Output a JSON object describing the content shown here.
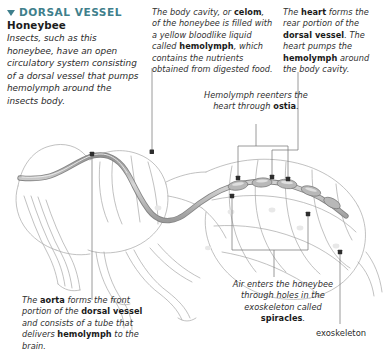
{
  "header": {
    "disclosure_icon": "triangle-down-icon",
    "section_title": "DORSAL VESSEL",
    "species": "Honeybee",
    "intro": "Insects, such as this honeybee, have an open circulatory system consisting of a dorsal vessel that pumps hemolymph around the insects body.",
    "accent_color": "#3f7f8c"
  },
  "callouts": {
    "celom": {
      "segments": [
        {
          "text": "The body cavity, or ",
          "bold": false
        },
        {
          "text": "celom",
          "bold": true
        },
        {
          "text": ", of the honeybee is filled with a yellow bloodlike liquid called ",
          "bold": false
        },
        {
          "text": "hemolymph",
          "bold": true
        },
        {
          "text": ", which contains the nutrients obtained from digested food.",
          "bold": false
        }
      ]
    },
    "heart": {
      "segments": [
        {
          "text": "The ",
          "bold": false
        },
        {
          "text": "heart",
          "bold": true
        },
        {
          "text": " forms the rear portion of the ",
          "bold": false
        },
        {
          "text": "dorsal vessel",
          "bold": true
        },
        {
          "text": ". The heart pumps the ",
          "bold": false
        },
        {
          "text": "hemolymph",
          "bold": true
        },
        {
          "text": " around the body cavity.",
          "bold": false
        }
      ]
    },
    "ostia": {
      "segments": [
        {
          "text": "Hemolymph reenters the heart through ",
          "bold": false
        },
        {
          "text": "ostia",
          "bold": true
        },
        {
          "text": ".",
          "bold": false
        }
      ]
    },
    "spiracles": {
      "segments": [
        {
          "text": "Air enters the honeybee through holes in the exoskeleton called ",
          "bold": false
        },
        {
          "text": "spiracles",
          "bold": true
        },
        {
          "text": ".",
          "bold": false
        }
      ]
    },
    "aorta": {
      "segments": [
        {
          "text": "The ",
          "bold": false
        },
        {
          "text": "aorta",
          "bold": true
        },
        {
          "text": " forms the front portion of the ",
          "bold": false
        },
        {
          "text": "dorsal vessel",
          "bold": true
        },
        {
          "text": " and consists of a tube that delivers ",
          "bold": false
        },
        {
          "text": "hemolymph",
          "bold": true
        },
        {
          "text": " to the brain.",
          "bold": false
        }
      ]
    },
    "exoskeleton_label": "exoskeleton"
  },
  "illustration": {
    "name": "honeybee-dorsal-vessel-diagram",
    "outline_color": "#9a9a9a",
    "vessel_color": "#8d8d8d",
    "vessel_fill": "#c9c9c9",
    "leader_color": "#6e6e6e"
  }
}
